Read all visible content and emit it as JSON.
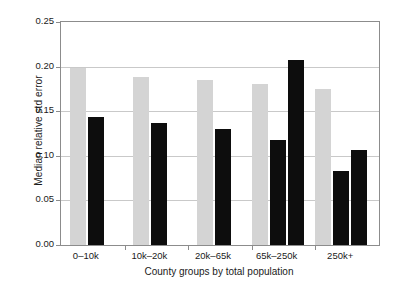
{
  "chart_data": {
    "type": "bar",
    "title": "",
    "xlabel": "County groups by total population",
    "ylabel": "Median relative std error",
    "categories": [
      "0–10k",
      "10k–20k",
      "20k–65k",
      "65k–250k",
      "250k+"
    ],
    "ylim": [
      0.0,
      0.25
    ],
    "yticks": [
      0.0,
      0.05,
      0.1,
      0.15,
      0.2,
      0.25
    ],
    "ytick_labels": [
      "0.00",
      "0.05",
      "0.10",
      "0.15",
      "0.20",
      "0.25"
    ],
    "grid": true,
    "legend": "none",
    "colors": {
      "light": "#d4d4d4",
      "dark": "#0d0d0d",
      "frame": "#8c8c8c",
      "gridline": "#c9c9c9",
      "background": "#ffffff"
    },
    "series": [
      {
        "name": "light-series",
        "color": "#d4d4d4",
        "values": [
          0.199,
          0.188,
          0.185,
          0.18,
          0.175
        ]
      },
      {
        "name": "dark-series-1",
        "color": "#0d0d0d",
        "values": [
          0.143,
          0.137,
          0.13,
          0.118,
          0.083
        ]
      },
      {
        "name": "dark-series-2",
        "color": "#0d0d0d",
        "values": [
          null,
          null,
          null,
          0.207,
          0.106
        ]
      }
    ],
    "bars": [
      {
        "group": "0–10k",
        "series": "light-series",
        "value": 0.199,
        "color": "#d4d4d4"
      },
      {
        "group": "0–10k",
        "series": "dark-series-1",
        "value": 0.143,
        "color": "#0d0d0d"
      },
      {
        "group": "10k–20k",
        "series": "light-series",
        "value": 0.188,
        "color": "#d4d4d4"
      },
      {
        "group": "10k–20k",
        "series": "dark-series-1",
        "value": 0.137,
        "color": "#0d0d0d"
      },
      {
        "group": "20k–65k",
        "series": "light-series",
        "value": 0.185,
        "color": "#d4d4d4"
      },
      {
        "group": "20k–65k",
        "series": "dark-series-1",
        "value": 0.13,
        "color": "#0d0d0d"
      },
      {
        "group": "65k–250k",
        "series": "light-series",
        "value": 0.18,
        "color": "#d4d4d4"
      },
      {
        "group": "65k–250k",
        "series": "dark-series-1",
        "value": 0.118,
        "color": "#0d0d0d"
      },
      {
        "group": "65k–250k",
        "series": "dark-series-2",
        "value": 0.207,
        "color": "#0d0d0d"
      },
      {
        "group": "250k+",
        "series": "light-series",
        "value": 0.175,
        "color": "#d4d4d4"
      },
      {
        "group": "250k+",
        "series": "dark-series-1",
        "value": 0.083,
        "color": "#0d0d0d"
      },
      {
        "group": "250k+",
        "series": "dark-series-2",
        "value": 0.106,
        "color": "#0d0d0d"
      }
    ]
  }
}
